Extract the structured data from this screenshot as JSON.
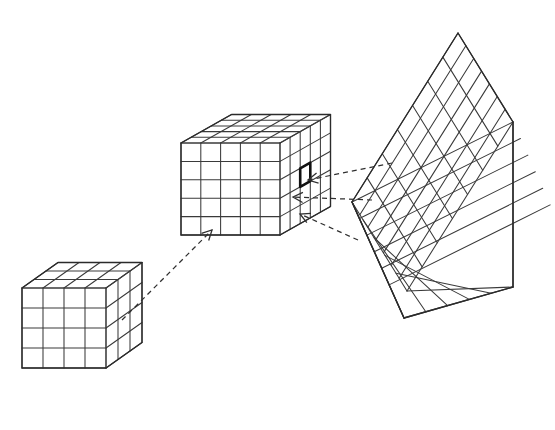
{
  "figure": {
    "background_color": "#ffffff",
    "line_color": "#3a3a3a",
    "highlight_color": "#111111",
    "width": 555,
    "height": 430
  },
  "objects": {
    "small_cube": {
      "label": "small voxel block",
      "cells_x": 4,
      "cells_y": 4,
      "cells_z": 4,
      "origin": {
        "x": 22,
        "y": 288
      },
      "cell_width": 21.0,
      "cell_height": 20.0,
      "depth_cells": 3,
      "depth_step_x": 12.0,
      "depth_step_y": -8.5
    },
    "medium_cube": {
      "label": "medium voxel block with highlighted cell",
      "cells_x": 5,
      "cells_y": 5,
      "cells_z": 5,
      "origin": {
        "x": 181,
        "y": 143
      },
      "cell_width": 19.8,
      "cell_height": 18.4,
      "depth_cells": 5,
      "depth_step_x": 10.1,
      "depth_step_y": -5.7,
      "highlight": {
        "col": 2,
        "row": 2,
        "face": "right"
      }
    },
    "large_corner": {
      "label": "magnified corner of voxel block",
      "apex": {
        "x": 458,
        "y": 33
      },
      "left_vertex": {
        "x": 352,
        "y": 202
      },
      "bottom_vertex": {
        "x": 404,
        "y": 318
      },
      "right_top": {
        "x": 513,
        "y": 122
      },
      "right_bottom": {
        "x": 513,
        "y": 287
      },
      "top_face_cells_u": 7,
      "top_face_cells_v": 7,
      "side_face_cols": 5,
      "side_face_rows": 7
    }
  },
  "arrows": [
    {
      "name": "arrow-small-to-medium",
      "from": {
        "x": 122,
        "y": 320
      },
      "to": {
        "x": 212,
        "y": 230
      },
      "style": "dashed",
      "head": "open"
    },
    {
      "name": "arrow-large-to-medium-upper",
      "from": {
        "x": 392,
        "y": 163
      },
      "to": {
        "x": 308,
        "y": 180
      },
      "style": "dashed",
      "head": "open"
    },
    {
      "name": "arrow-large-to-medium-middle",
      "from": {
        "x": 372,
        "y": 200
      },
      "to": {
        "x": 293,
        "y": 197
      },
      "style": "dashed",
      "head": "open"
    },
    {
      "name": "arrow-large-to-medium-lower",
      "from": {
        "x": 358,
        "y": 240
      },
      "to": {
        "x": 300,
        "y": 214
      },
      "style": "dashed",
      "head": "open"
    }
  ],
  "chart_data": {
    "type": "diagram",
    "elements": [
      {
        "id": "small-cube",
        "kind": "isometric-grid-box",
        "grid": "4x4x4",
        "role": "coarse scale"
      },
      {
        "id": "medium-cube",
        "kind": "isometric-grid-box",
        "grid": "5x5x5",
        "role": "intermediate scale, one cell highlighted"
      },
      {
        "id": "large-corner",
        "kind": "isometric-grid-corner",
        "grid": "7x7 top, 5x7 side",
        "role": "magnified detail of highlighted cell region"
      }
    ],
    "connections": [
      {
        "from": "small-cube",
        "to": "medium-cube",
        "style": "dashed arrow"
      },
      {
        "from": "large-corner",
        "to": "medium-cube",
        "style": "dashed arrow",
        "count": 3
      }
    ]
  }
}
